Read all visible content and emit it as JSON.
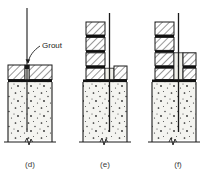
{
  "figure": {
    "annotation": {
      "label": "Grout",
      "name": "grout-callout"
    },
    "captions": [
      {
        "key": "d",
        "label": "(d)"
      },
      {
        "key": "e",
        "label": "(e)"
      },
      {
        "key": "f",
        "label": "(f)"
      }
    ],
    "colors": {
      "line": "#1a1a1a",
      "concrete_fill": "#f4f4f0",
      "aggregate": "#2b2b2b",
      "hatch": "#1a1a1a",
      "mortar_joint": "#111111",
      "grout_fill": "#efefe9",
      "caption": "#3a3a3a"
    },
    "panels": [
      {
        "key": "d",
        "name": "panel-d",
        "description": "Concrete column with bar projecting and cap blocks set, grout pocket at bar",
        "block_courses": 0,
        "has_bar": true,
        "has_break_line": true
      },
      {
        "key": "e",
        "name": "panel-e",
        "description": "Masonry units stacked on left with single right unit, bar continues through grout space",
        "block_courses": 4,
        "has_bar": true,
        "has_break_line": true
      },
      {
        "key": "f",
        "name": "panel-f",
        "description": "Masonry units stacked both sides of bar with grouted cavity between",
        "block_courses": 4,
        "has_bar": true,
        "has_break_line": true
      }
    ]
  }
}
